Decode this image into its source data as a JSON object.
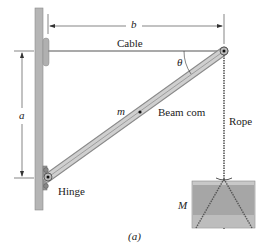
{
  "labels": {
    "b": "b",
    "cable": "Cable",
    "theta": "θ",
    "a": "a",
    "m": "m",
    "beam_com": "Beam com",
    "rope": "Rope",
    "hinge": "Hinge",
    "M": "M",
    "caption": "(a)"
  },
  "colors": {
    "wall": "#b3b3b3",
    "beam": "#c4c4c4",
    "block": "#a9a9a9",
    "text": "#222222"
  }
}
